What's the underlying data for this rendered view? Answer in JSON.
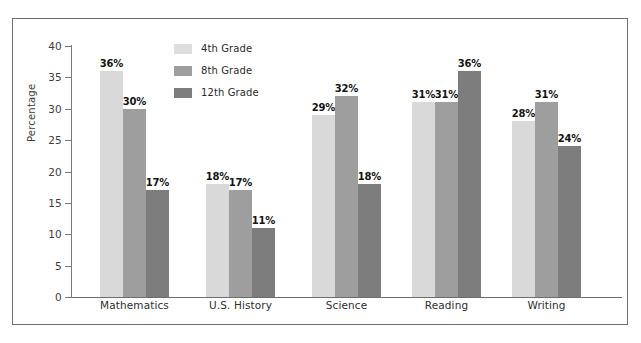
{
  "chart_data": {
    "type": "bar",
    "title": "",
    "subtitle": "",
    "xlabel": "",
    "ylabel": "Percentage",
    "ylim": [
      0,
      40
    ],
    "ytick_labels": [
      "0",
      "5",
      "10",
      "15",
      "20",
      "25",
      "30",
      "35",
      "40"
    ],
    "ytick_values": [
      0,
      5,
      10,
      15,
      20,
      25,
      30,
      35,
      40
    ],
    "grid": false,
    "legend_position": "top-center",
    "value_label_suffix": "%",
    "categories": [
      "Mathematics",
      "U.S. History",
      "Science",
      "Reading",
      "Writing"
    ],
    "series": [
      {
        "name": "4th Grade",
        "color": "#d9d9d9",
        "values": [
          36,
          18,
          29,
          31,
          28
        ],
        "labels": [
          "36%",
          "18%",
          "29%",
          "31%",
          "28%"
        ]
      },
      {
        "name": "8th Grade",
        "color": "#9e9e9e",
        "values": [
          30,
          17,
          32,
          31,
          31
        ],
        "labels": [
          "30%",
          "17%",
          "32%",
          "31%",
          "31%"
        ]
      },
      {
        "name": "12th Grade",
        "color": "#7d7d7d",
        "values": [
          17,
          11,
          18,
          36,
          24
        ],
        "labels": [
          "17%",
          "11%",
          "18%",
          "36%",
          "24%"
        ]
      }
    ]
  },
  "legend": {
    "items": [
      {
        "label": "4th Grade",
        "color": "#dedede"
      },
      {
        "label": "8th Grade",
        "color": "#9e9e9e"
      },
      {
        "label": "12th Grade",
        "color": "#7d7d7d"
      }
    ]
  },
  "axes": {
    "y_axis_label": "Percentage"
  }
}
